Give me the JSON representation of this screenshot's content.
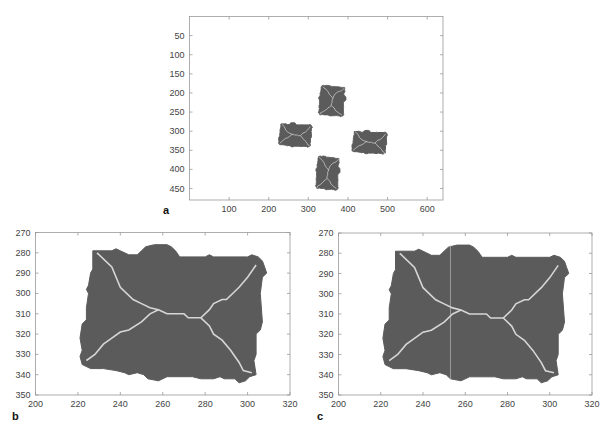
{
  "figure": {
    "colors": {
      "blob_fill": "#5b5b5b",
      "skeleton": "#d6d6d6",
      "axis": "#999999",
      "background": "#ffffff",
      "cut_line": "#c8c8c8"
    }
  },
  "chart_data": [
    {
      "id": "a",
      "panel_label": "a",
      "type": "scatter",
      "title": "",
      "xlabel": "",
      "ylabel": "",
      "xlim": [
        0,
        640
      ],
      "ylim": [
        480,
        0
      ],
      "y_inverted": true,
      "grid": false,
      "xticks": [
        100,
        200,
        300,
        400,
        500,
        600
      ],
      "yticks": [
        50,
        100,
        150,
        200,
        250,
        300,
        350,
        400,
        450
      ],
      "description": "Binary image of four rectangular particles with skeleton lines",
      "objects": [
        {
          "name": "top",
          "x_range": [
            325,
            395
          ],
          "y_range": [
            180,
            262
          ]
        },
        {
          "name": "left",
          "x_range": [
            225,
            310
          ],
          "y_range": [
            278,
            342
          ]
        },
        {
          "name": "right",
          "x_range": [
            410,
            500
          ],
          "y_range": [
            298,
            360
          ]
        },
        {
          "name": "bottom",
          "x_range": [
            318,
            380
          ],
          "y_range": [
            365,
            455
          ]
        }
      ]
    },
    {
      "id": "b",
      "panel_label": "b",
      "type": "scatter",
      "title": "",
      "xlabel": "",
      "ylabel": "",
      "xlim": [
        200,
        320
      ],
      "ylim": [
        350,
        270
      ],
      "y_inverted": true,
      "grid": false,
      "xticks": [
        200,
        220,
        240,
        260,
        280,
        300,
        320
      ],
      "yticks": [
        270,
        280,
        290,
        300,
        310,
        320,
        330,
        340,
        350
      ],
      "description": "Zoomed particle with medial-axis skeleton",
      "skeleton_nodes": [
        [
          258,
          308
        ],
        [
          278,
          312
        ]
      ],
      "skeleton_endpoints": [
        [
          229,
          280
        ],
        [
          304,
          286
        ],
        [
          224,
          333
        ],
        [
          302,
          339
        ]
      ]
    },
    {
      "id": "c",
      "panel_label": "c",
      "type": "scatter",
      "title": "",
      "xlabel": "",
      "ylabel": "",
      "xlim": [
        200,
        320
      ],
      "ylim": [
        350,
        270
      ],
      "y_inverted": true,
      "grid": false,
      "xticks": [
        200,
        220,
        240,
        260,
        280,
        300,
        320
      ],
      "yticks": [
        270,
        280,
        290,
        300,
        310,
        320,
        330,
        340,
        350
      ],
      "description": "Same particle with a vertical separation line",
      "cut_line_x": 253,
      "skeleton_nodes": [
        [
          258,
          308
        ],
        [
          278,
          312
        ]
      ],
      "skeleton_endpoints": [
        [
          229,
          280
        ],
        [
          304,
          286
        ],
        [
          224,
          333
        ],
        [
          302,
          339
        ]
      ]
    }
  ],
  "shapes": {
    "blob_outline": [
      [
        227,
        279
      ],
      [
        236,
        279
      ],
      [
        238,
        278
      ],
      [
        240,
        279
      ],
      [
        244,
        281
      ],
      [
        248,
        281
      ],
      [
        250,
        279
      ],
      [
        252,
        277
      ],
      [
        256,
        276
      ],
      [
        262,
        276
      ],
      [
        264,
        277
      ],
      [
        266,
        279
      ],
      [
        268,
        282
      ],
      [
        280,
        282
      ],
      [
        282,
        281
      ],
      [
        284,
        282
      ],
      [
        300,
        282
      ],
      [
        302,
        281
      ],
      [
        305,
        282
      ],
      [
        307,
        284
      ],
      [
        308,
        287
      ],
      [
        309,
        290
      ],
      [
        307,
        292
      ],
      [
        306,
        300
      ],
      [
        307,
        314
      ],
      [
        306,
        318
      ],
      [
        304,
        320
      ],
      [
        304,
        330
      ],
      [
        303,
        333
      ],
      [
        304,
        340
      ],
      [
        301,
        341
      ],
      [
        299,
        343
      ],
      [
        296,
        344
      ],
      [
        294,
        342
      ],
      [
        289,
        342
      ],
      [
        287,
        341
      ],
      [
        284,
        342
      ],
      [
        278,
        342
      ],
      [
        274,
        341
      ],
      [
        262,
        341
      ],
      [
        258,
        343
      ],
      [
        253,
        342
      ],
      [
        251,
        340
      ],
      [
        248,
        339
      ],
      [
        244,
        340
      ],
      [
        242,
        339
      ],
      [
        238,
        338
      ],
      [
        232,
        337
      ],
      [
        226,
        337
      ],
      [
        222,
        335
      ],
      [
        221,
        331
      ],
      [
        222,
        328
      ],
      [
        221,
        322
      ],
      [
        222,
        315
      ],
      [
        224,
        313
      ],
      [
        224,
        307
      ],
      [
        225,
        300
      ],
      [
        224,
        298
      ],
      [
        225,
        296
      ],
      [
        226,
        290
      ],
      [
        227,
        288
      ]
    ],
    "skeleton_main": [
      [
        229,
        280
      ],
      [
        236,
        287
      ],
      [
        238,
        292
      ],
      [
        240,
        297
      ],
      [
        246,
        303
      ],
      [
        250,
        305
      ],
      [
        254,
        307
      ],
      [
        258,
        308
      ],
      [
        262,
        310
      ],
      [
        270,
        310
      ],
      [
        272,
        312
      ],
      [
        278,
        312
      ],
      [
        282,
        308
      ],
      [
        284,
        305
      ],
      [
        288,
        303
      ],
      [
        290,
        303
      ],
      [
        296,
        297
      ],
      [
        300,
        292
      ],
      [
        304,
        286
      ]
    ],
    "skeleton_lower_left": [
      [
        258,
        308
      ],
      [
        254,
        310
      ],
      [
        250,
        314
      ],
      [
        244,
        318
      ],
      [
        240,
        319
      ],
      [
        236,
        322
      ],
      [
        232,
        325
      ],
      [
        228,
        330
      ],
      [
        224,
        333
      ]
    ],
    "skeleton_lower_right": [
      [
        278,
        312
      ],
      [
        282,
        316
      ],
      [
        284,
        320
      ],
      [
        288,
        323
      ],
      [
        292,
        328
      ],
      [
        296,
        334
      ],
      [
        298,
        338
      ],
      [
        302,
        339
      ]
    ]
  }
}
